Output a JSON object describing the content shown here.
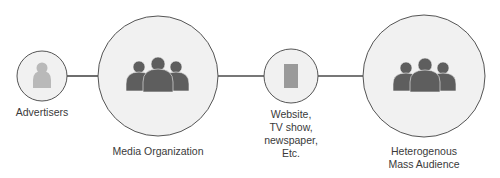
{
  "diagram": {
    "type": "flow",
    "colors": {
      "circle_fill": "#f1f1f1",
      "circle_stroke": "#555555",
      "connector": "#4a4a4a",
      "group_icon": "#5e5e5e",
      "advertiser_icon": "#b9b9b9",
      "media_icon": "#9a9a9a",
      "label_text": "#3a3a3a"
    },
    "nodes": [
      {
        "id": "advertisers",
        "label": "Advertisers",
        "icon": "single-person-icon"
      },
      {
        "id": "media_organization",
        "label": "Media Organization",
        "icon": "group-people-icon"
      },
      {
        "id": "media_outlet",
        "label_lines": [
          "Website,",
          "TV show,",
          "newspaper,",
          "Etc."
        ],
        "icon": "media-rectangle-icon"
      },
      {
        "id": "mass_audience",
        "label_lines": [
          "Heterogenous",
          "Mass Audience"
        ],
        "icon": "group-people-icon"
      }
    ],
    "edges": [
      {
        "from": "advertisers",
        "to": "media_organization"
      },
      {
        "from": "media_organization",
        "to": "media_outlet"
      },
      {
        "from": "media_outlet",
        "to": "mass_audience"
      }
    ]
  }
}
